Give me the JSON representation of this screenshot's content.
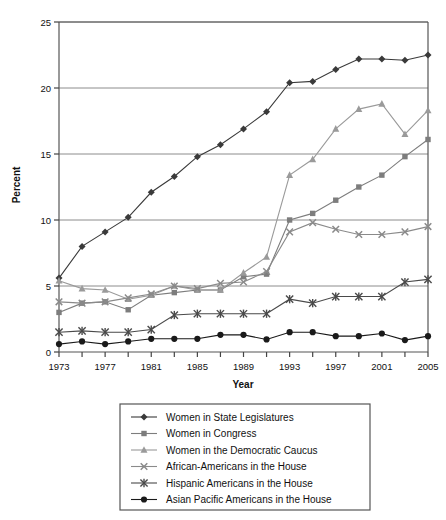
{
  "chart_data": {
    "type": "line",
    "title": "",
    "xlabel": "Year",
    "ylabel": "Percent",
    "xlim": [
      1973,
      2005
    ],
    "ylim": [
      0,
      25
    ],
    "yticks": [
      0,
      5,
      10,
      15,
      20,
      25
    ],
    "xticks": [
      1973,
      1975,
      1977,
      1979,
      1981,
      1983,
      1985,
      1987,
      1989,
      1991,
      1993,
      1995,
      1997,
      1999,
      2001,
      2003,
      2005
    ],
    "xtick_labels": [
      "1973",
      "",
      "1977",
      "",
      "1981",
      "",
      "1985",
      "",
      "1989",
      "",
      "1993",
      "",
      "1997",
      "",
      "2001",
      "",
      "2005"
    ],
    "grid": "horizontal",
    "legend_position": "below",
    "x": [
      1973,
      1975,
      1977,
      1979,
      1981,
      1983,
      1985,
      1987,
      1989,
      1991,
      1993,
      1995,
      1997,
      1999,
      2001,
      2003,
      2005
    ],
    "series": [
      {
        "name": "Women in State Legislatures",
        "marker": "diamond",
        "color": "#3a3a3a",
        "values": [
          5.6,
          8.0,
          9.1,
          10.2,
          12.1,
          13.3,
          14.8,
          15.7,
          16.9,
          18.2,
          20.4,
          20.5,
          21.4,
          22.2,
          22.2,
          22.1,
          22.5
        ]
      },
      {
        "name": "Women in Congress",
        "marker": "square",
        "color": "#7d7d7d",
        "values": [
          3.0,
          3.7,
          3.8,
          3.2,
          4.3,
          4.5,
          4.7,
          4.7,
          5.7,
          5.9,
          10.0,
          10.5,
          11.5,
          12.5,
          13.4,
          14.8,
          16.1
        ]
      },
      {
        "name": "Women in the Democratic Caucus",
        "marker": "triangle",
        "color": "#9a9a9a",
        "values": [
          5.4,
          4.8,
          4.7,
          4.0,
          4.3,
          5.0,
          4.7,
          4.7,
          6.0,
          7.2,
          13.4,
          14.6,
          16.9,
          18.4,
          18.8,
          16.5,
          18.3
        ]
      },
      {
        "name": "African-Americans in the House",
        "marker": "x",
        "color": "#8a8a8a",
        "values": [
          3.8,
          3.7,
          3.8,
          4.1,
          4.4,
          5.0,
          4.8,
          5.2,
          5.3,
          6.1,
          9.1,
          9.8,
          9.3,
          8.9,
          8.9,
          9.1,
          9.5
        ]
      },
      {
        "name": "Hispanic Americans in the House",
        "marker": "asterisk",
        "color": "#4a4a4a",
        "values": [
          1.5,
          1.6,
          1.5,
          1.5,
          1.7,
          2.8,
          2.9,
          2.9,
          2.9,
          2.9,
          4.0,
          3.7,
          4.2,
          4.2,
          4.2,
          5.3,
          5.5
        ]
      },
      {
        "name": "Asian Pacific Americans in the House",
        "marker": "circle",
        "color": "#1a1a1a",
        "values": [
          0.6,
          0.8,
          0.6,
          0.8,
          1.0,
          1.0,
          1.0,
          1.3,
          1.3,
          0.95,
          1.5,
          1.5,
          1.2,
          1.2,
          1.4,
          0.9,
          1.2
        ]
      }
    ]
  },
  "legend": {
    "items": [
      {
        "label": "Women in State Legislatures",
        "marker": "diamond",
        "color": "#3a3a3a"
      },
      {
        "label": "Women in Congress",
        "marker": "square",
        "color": "#7d7d7d"
      },
      {
        "label": "Women in the Democratic Caucus",
        "marker": "triangle",
        "color": "#9a9a9a"
      },
      {
        "label": "African-Americans in the House",
        "marker": "x",
        "color": "#8a8a8a"
      },
      {
        "label": "Hispanic Americans in the House",
        "marker": "asterisk",
        "color": "#4a4a4a"
      },
      {
        "label": "Asian Pacific Americans in the House",
        "marker": "circle",
        "color": "#1a1a1a"
      }
    ]
  }
}
